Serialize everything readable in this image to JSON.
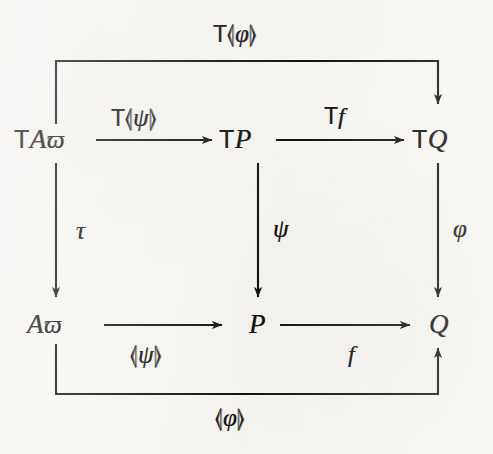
{
  "figure": {
    "kind": "commutative-diagram",
    "background_color": "#f7f6f2",
    "ink_color": "#14120f",
    "width": 493,
    "height": 454
  },
  "nodes": {
    "top_left": {
      "id": "TAvarpi",
      "parts": {
        "functor": "T",
        "object": "A",
        "index": "ϖ"
      }
    },
    "top_middle": {
      "id": "TP",
      "parts": {
        "functor": "T",
        "object": "P",
        "index": ""
      }
    },
    "top_right": {
      "id": "TQ",
      "parts": {
        "functor": "T",
        "object": "Q",
        "index": ""
      }
    },
    "bottom_left": {
      "id": "Avarpi",
      "parts": {
        "functor": "",
        "object": "A",
        "index": "ϖ"
      }
    },
    "bottom_middle": {
      "id": "P",
      "parts": {
        "functor": "",
        "object": "P",
        "index": ""
      }
    },
    "bottom_right": {
      "id": "Q",
      "parts": {
        "functor": "",
        "object": "Q",
        "index": ""
      }
    }
  },
  "arrows": {
    "top_outer": {
      "label_parts": {
        "functor": "T",
        "open": "⦉",
        "inner": "φ",
        "close": "⦊"
      },
      "label_text": "T⦉ φ ⦊",
      "from": "TAvarpi",
      "to": "TQ",
      "routing": "up-right-down"
    },
    "top_left_edge": {
      "label_parts": {
        "functor": "T",
        "open": "⦉",
        "inner": "ψ",
        "close": "⦊"
      },
      "label_text": "T⦉ ψ ⦊",
      "from": "TAvarpi",
      "to": "TP",
      "routing": "horizontal"
    },
    "top_right_edge": {
      "label_parts": {
        "functor": "T",
        "open": "",
        "inner": "f",
        "close": ""
      },
      "label_text": "Tf",
      "from": "TP",
      "to": "TQ",
      "routing": "horizontal"
    },
    "left_vertical": {
      "label_parts": {
        "functor": "",
        "open": "",
        "inner": "τ",
        "close": ""
      },
      "label_text": "τ",
      "from": "TAvarpi",
      "to": "Avarpi",
      "routing": "vertical"
    },
    "middle_vertical": {
      "label_parts": {
        "functor": "",
        "open": "",
        "inner": "ψ",
        "close": ""
      },
      "label_text": "ψ",
      "from": "TP",
      "to": "P",
      "routing": "vertical"
    },
    "right_vertical": {
      "label_parts": {
        "functor": "",
        "open": "",
        "inner": "φ",
        "close": ""
      },
      "label_text": "φ",
      "from": "TQ",
      "to": "Q",
      "routing": "vertical"
    },
    "bottom_left_edge": {
      "label_parts": {
        "functor": "",
        "open": "⦉",
        "inner": "ψ",
        "close": "⦊"
      },
      "label_text": "⦉ ψ ⦊",
      "from": "Avarpi",
      "to": "P",
      "routing": "horizontal"
    },
    "bottom_right_edge": {
      "label_parts": {
        "functor": "",
        "open": "",
        "inner": "f",
        "close": ""
      },
      "label_text": "f",
      "from": "P",
      "to": "Q",
      "routing": "horizontal"
    },
    "bottom_outer": {
      "label_parts": {
        "functor": "",
        "open": "⦉",
        "inner": "φ",
        "close": "⦊"
      },
      "label_text": "⦉ φ ⦊",
      "from": "Avarpi",
      "to": "Q",
      "routing": "down-right-up"
    }
  }
}
